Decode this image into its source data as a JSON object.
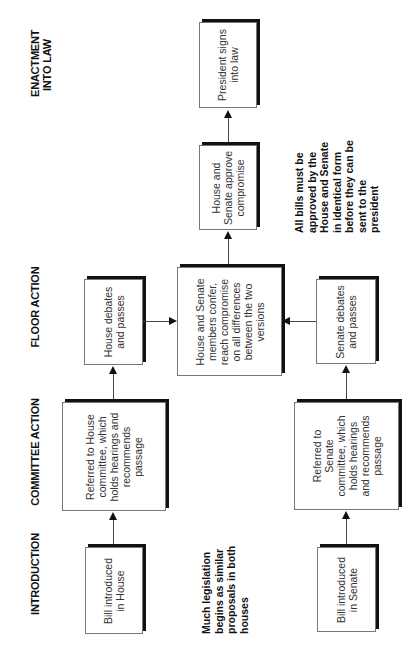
{
  "stages": {
    "introduction": "INTRODUCTION",
    "committee_action": "COMMITTEE ACTION",
    "floor_action": "FLOOR ACTION",
    "enactment": "ENACTMENT\nINTO LAW"
  },
  "boxes": {
    "bill_house": "Bill introduced\nin House",
    "bill_senate": "Bill introduced\nin Senate",
    "committee_house": "Referred to House\ncommittee, which\nholds hearings and\nrecommends\npassage",
    "committee_senate": "Referred to\nSenate\ncommittee, which\nholds hearings\nand recommends\npassage",
    "floor_house": "House debates\nand passes",
    "floor_senate": "Senate debates\nand passes",
    "conference": "House and Senate\nmembers confer,\nreach compromise\non all differences\nbetween the two\nversions",
    "approve": "House and\nSenate approve\ncompromise",
    "president": "President signs\ninto law"
  },
  "notes": {
    "similar_proposals": "Much legislation\nbegins as similar\nproposals in both\nhouses",
    "identical_form": "All bills must be\napproved by the\nHouse and Senate\nin identical form\nbefore they can be\nsent to the\npresident"
  },
  "colors": {
    "border": "#777777",
    "shadow": "#111111",
    "text": "#333333",
    "heading": "#111111"
  }
}
